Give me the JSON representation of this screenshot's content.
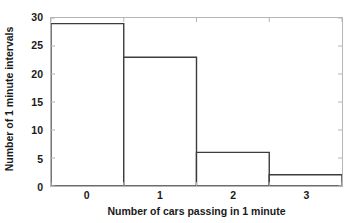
{
  "chart_data": {
    "type": "bar",
    "title": "",
    "subtitle": "",
    "xlabel": "Number of cars passing in 1 minute",
    "ylabel": "Number of 1 minute intervals",
    "categories": [
      "0",
      "1",
      "2",
      "3"
    ],
    "x": [
      0,
      1,
      2,
      3
    ],
    "values": [
      29,
      23,
      6,
      2
    ],
    "bin_edges": [
      -0.5,
      0.5,
      1.5,
      2.5,
      3.5
    ],
    "xlim": [
      -0.5,
      3.5
    ],
    "ylim": [
      0,
      30
    ],
    "xticks": [
      "0",
      "1",
      "2",
      "3"
    ],
    "yticks": [
      "0",
      "5",
      "10",
      "15",
      "20",
      "25",
      "30"
    ],
    "ytick_values": [
      0,
      5,
      10,
      15,
      20,
      25,
      30
    ],
    "grid": false,
    "legend": false,
    "legend_position": "none",
    "bar_fill": "#ffffff",
    "bar_edge_color": "#3c3c3c",
    "axis_color": "#b5b5b5",
    "text_color": "#1a1a1a",
    "background": "#ffffff"
  }
}
